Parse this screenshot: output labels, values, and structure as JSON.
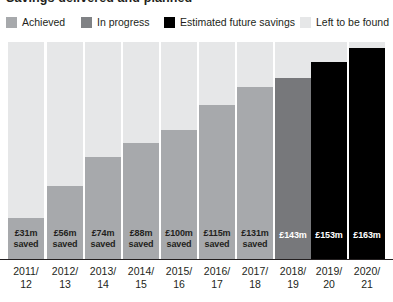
{
  "title": "Savings delivered and planned",
  "legend": [
    {
      "label": "Achieved",
      "color": "#a7a9ac",
      "x": 6,
      "key": "achieved"
    },
    {
      "label": "In progress",
      "color": "#808285",
      "x": 81,
      "key": "in_progress"
    },
    {
      "label": "Estimated future savings",
      "color": "#000000",
      "x": 164,
      "key": "estimated_future"
    },
    {
      "label": "Left to be found",
      "color": "#e6e7e8",
      "x": 300,
      "key": "left_to_be_found"
    }
  ],
  "chart_data": {
    "type": "bar",
    "title": "Savings delivered and planned",
    "xlabel": "",
    "ylabel": "",
    "grid": false,
    "legend_position": "top",
    "stacked": true,
    "ylim": [
      0,
      200
    ],
    "axis_note": "All columns share the same total height; filled portion = cumulative savings, remainder = left to be found",
    "categories": [
      "2011/12",
      "2012/13",
      "2013/14",
      "2014/15",
      "2015/16",
      "2016/17",
      "2017/18",
      "2018/19",
      "2019/20",
      "2020/21"
    ],
    "category_lines": [
      [
        "2011/",
        "12"
      ],
      [
        "2012/",
        "13"
      ],
      [
        "2013/",
        "14"
      ],
      [
        "2014/",
        "15"
      ],
      [
        "2015/",
        "16"
      ],
      [
        "2016/",
        "17"
      ],
      [
        "2017/",
        "18"
      ],
      [
        "2018/",
        "19"
      ],
      [
        "2019/",
        "20"
      ],
      [
        "2020/",
        "21"
      ]
    ],
    "values": [
      31,
      56,
      74,
      88,
      100,
      115,
      131,
      143,
      153,
      163
    ],
    "value_labels": [
      "£31m",
      "£56m",
      "£74m",
      "£88m",
      "£100m",
      "£115m",
      "£131m",
      "£143m",
      "£153m",
      "£163m"
    ],
    "value_sublabels": [
      "saved",
      "saved",
      "saved",
      "saved",
      "saved",
      "saved",
      "saved",
      "",
      "",
      ""
    ],
    "series_per_bar": [
      "achieved",
      "achieved",
      "achieved",
      "achieved",
      "achieved",
      "achieved",
      "achieved",
      "in_progress",
      "estimated_future",
      "estimated_future"
    ],
    "colors": {
      "achieved": "#a7a9ac",
      "in_progress": "#808285",
      "estimated_future": "#000000",
      "left_to_be_found": "#e6e7e8"
    }
  },
  "bars": [
    {
      "value_label": "£31m",
      "sub": "saved",
      "fill_color": "#a7a9ac",
      "track_color": "#e6e7e8",
      "fill_px": 41,
      "x": 8,
      "w": 36,
      "text": "dark"
    },
    {
      "value_label": "£56m",
      "sub": "saved",
      "fill_color": "#a7a9ac",
      "track_color": "#e6e7e8",
      "fill_px": 73,
      "x": 47,
      "w": 36,
      "text": "dark"
    },
    {
      "value_label": "£74m",
      "sub": "saved",
      "fill_color": "#a7a9ac",
      "track_color": "#e6e7e8",
      "fill_px": 102,
      "x": 85,
      "w": 36,
      "text": "dark"
    },
    {
      "value_label": "£88m",
      "sub": "saved",
      "fill_color": "#a7a9ac",
      "track_color": "#e6e7e8",
      "fill_px": 116,
      "x": 123,
      "w": 36,
      "text": "dark"
    },
    {
      "value_label": "£100m",
      "sub": "saved",
      "fill_color": "#a7a9ac",
      "track_color": "#e6e7e8",
      "fill_px": 129,
      "x": 161,
      "w": 36,
      "text": "dark"
    },
    {
      "value_label": "£115m",
      "sub": "saved",
      "fill_color": "#a7a9ac",
      "track_color": "#e6e7e8",
      "fill_px": 154,
      "x": 199,
      "w": 36,
      "text": "dark"
    },
    {
      "value_label": "£131m",
      "sub": "saved",
      "fill_color": "#a7a9ac",
      "track_color": "#e6e7e8",
      "fill_px": 172,
      "x": 237,
      "w": 36,
      "text": "dark"
    },
    {
      "value_label": "£143m",
      "sub": "",
      "fill_color": "#77787b",
      "track_color": "#e6e7e8",
      "fill_px": 181,
      "x": 275,
      "w": 36,
      "text": "light"
    },
    {
      "value_label": "£153m",
      "sub": "",
      "fill_color": "#000000",
      "track_color": "#e6e7e8",
      "fill_px": 197,
      "x": 311,
      "w": 36,
      "text": "light"
    },
    {
      "value_label": "£163m",
      "sub": "",
      "fill_color": "#000000",
      "track_color": "#e6e7e8",
      "fill_px": 211,
      "x": 349,
      "w": 36,
      "text": "light"
    }
  ]
}
